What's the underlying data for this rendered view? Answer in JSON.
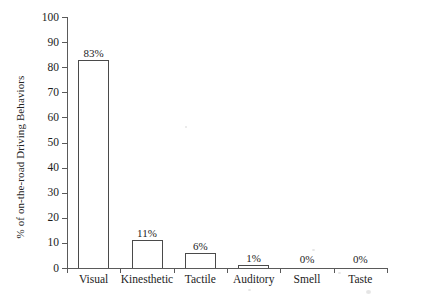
{
  "chart_data": {
    "type": "bar",
    "title": "",
    "subtitle": "",
    "xlabel": "",
    "ylabel": "% of on-the-road Driving Behaviors",
    "categories": [
      "Visual",
      "Kinesthetic",
      "Tactile",
      "Auditory",
      "Smell",
      "Taste"
    ],
    "values": [
      83,
      11,
      6,
      1,
      0,
      0
    ],
    "data_labels": [
      "83%",
      "11%",
      "6%",
      "1%",
      "0%",
      "0%"
    ],
    "ylim": [
      0,
      100
    ],
    "ytick_labels": [
      "0",
      "10",
      "20",
      "30",
      "40",
      "50",
      "60",
      "70",
      "80",
      "90",
      "100"
    ],
    "ytick_values": [
      0,
      10,
      20,
      30,
      40,
      50,
      60,
      70,
      80,
      90,
      100
    ],
    "grid": false,
    "legend": false,
    "legend_position": "none",
    "bar_fill_color": "#ffffff",
    "bar_edge_color": "#4a4a4a",
    "axis_color": "#5a5a5a",
    "background_color": "#ffffff",
    "text_color": "#1c1c1c"
  }
}
